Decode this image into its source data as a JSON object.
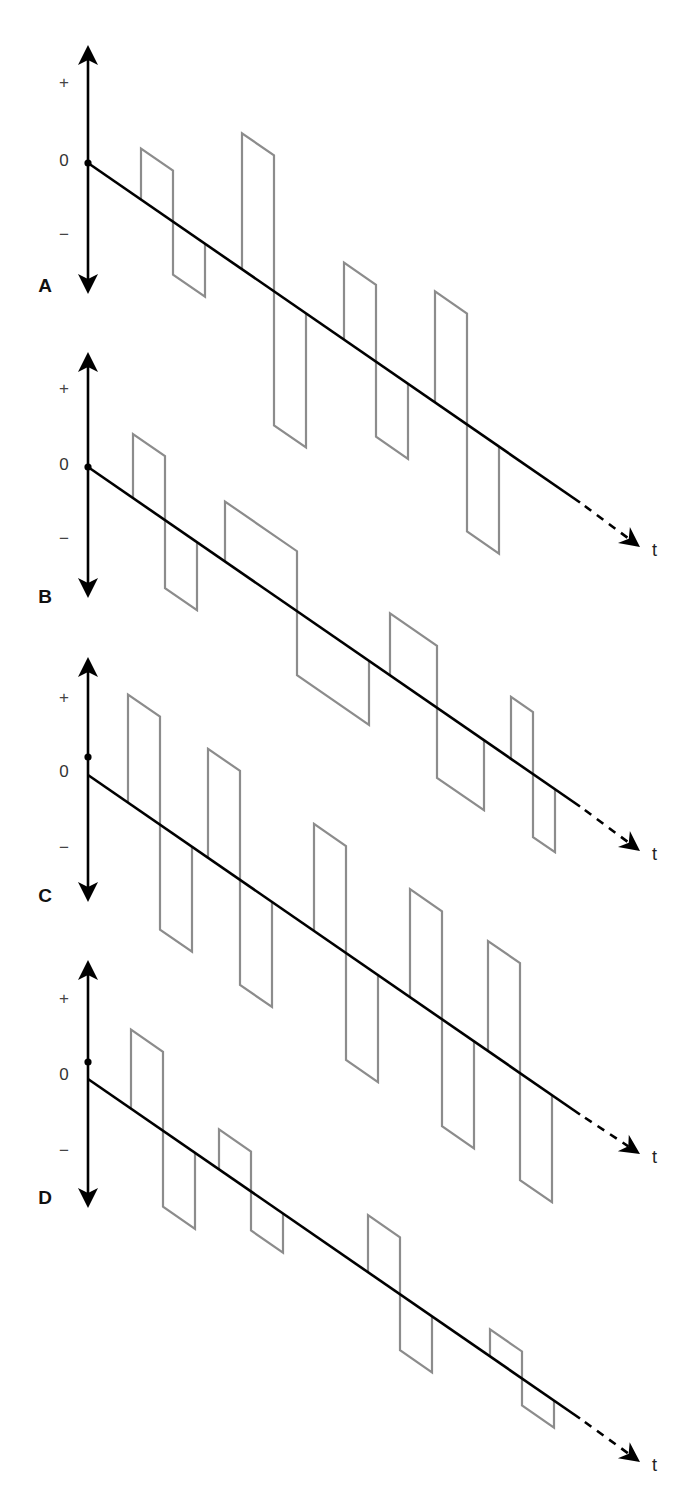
{
  "figure": {
    "colors": {
      "axis": "#000000",
      "baseline": "#000000",
      "pulse": "#8c8c8c",
      "background": "#ffffff"
    },
    "axis_labels": {
      "plus": "+",
      "zero": "0",
      "minus": "−",
      "time": "t"
    },
    "slope": 0.69,
    "pulse_skew": 0.69,
    "panels": [
      {
        "id": "A",
        "label": "A",
        "axis_x": 88,
        "axis_top": 45,
        "axis_bottom": 294,
        "dot_y": 163,
        "baseline_y0": 163,
        "plus_y": 88,
        "zero_y": 166,
        "minus_y": 240,
        "letter_y": 292,
        "baseline_end_x": 580,
        "arrow_tip": [
          640,
          547
        ],
        "t_pos": [
          652,
          556
        ],
        "pulses": [
          {
            "x": 141,
            "w": 32,
            "up": 51,
            "down": 53
          },
          {
            "x": 242,
            "w": 32,
            "up": 136,
            "down": 134
          },
          {
            "x": 344,
            "w": 32,
            "up": 77,
            "down": 75
          },
          {
            "x": 435,
            "w": 32,
            "up": 111,
            "down": 107
          }
        ]
      },
      {
        "id": "B",
        "label": "B",
        "axis_x": 88,
        "axis_top": 352,
        "axis_bottom": 598,
        "dot_y": 467,
        "baseline_y0": 467,
        "plus_y": 394,
        "zero_y": 470,
        "minus_y": 544,
        "letter_y": 603,
        "baseline_end_x": 580,
        "arrow_tip": [
          640,
          851
        ],
        "t_pos": [
          652,
          860
        ],
        "pulses": [
          {
            "x": 133,
            "w": 32,
            "up": 64,
            "down": 68
          },
          {
            "x": 225,
            "w": 72,
            "up": 60,
            "down": 64
          },
          {
            "x": 390,
            "w": 47,
            "up": 62,
            "down": 70
          },
          {
            "x": 511,
            "w": 22,
            "up": 62,
            "down": 63
          }
        ]
      },
      {
        "id": "C",
        "label": "C",
        "axis_x": 88,
        "axis_top": 657,
        "axis_bottom": 902,
        "dot_y": 757,
        "baseline_y0": 775,
        "plus_y": 703,
        "zero_y": 777,
        "minus_y": 853,
        "letter_y": 902,
        "baseline_end_x": 580,
        "arrow_tip": [
          640,
          1154
        ],
        "t_pos": [
          652,
          1163
        ],
        "pulses": [
          {
            "x": 128,
            "w": 32,
            "up": 108,
            "down": 105
          },
          {
            "x": 208,
            "w": 32,
            "up": 109,
            "down": 105
          },
          {
            "x": 314,
            "w": 32,
            "up": 107,
            "down": 107
          },
          {
            "x": 410,
            "w": 32,
            "up": 108,
            "down": 107
          },
          {
            "x": 488,
            "w": 32,
            "up": 110,
            "down": 107
          }
        ]
      },
      {
        "id": "D",
        "label": "D",
        "axis_x": 88,
        "axis_top": 960,
        "axis_bottom": 1208,
        "dot_y": 1062,
        "baseline_y0": 1079,
        "plus_y": 1004,
        "zero_y": 1080,
        "minus_y": 1156,
        "letter_y": 1204,
        "baseline_end_x": 580,
        "arrow_tip": [
          640,
          1462
        ],
        "t_pos": [
          652,
          1471
        ],
        "pulses": [
          {
            "x": 131,
            "w": 32,
            "up": 79,
            "down": 76
          },
          {
            "x": 219,
            "w": 32,
            "up": 40,
            "down": 39
          },
          {
            "x": 368,
            "w": 32,
            "up": 57,
            "down": 56
          },
          {
            "x": 490,
            "w": 32,
            "up": 27,
            "down": 27
          }
        ]
      }
    ]
  }
}
